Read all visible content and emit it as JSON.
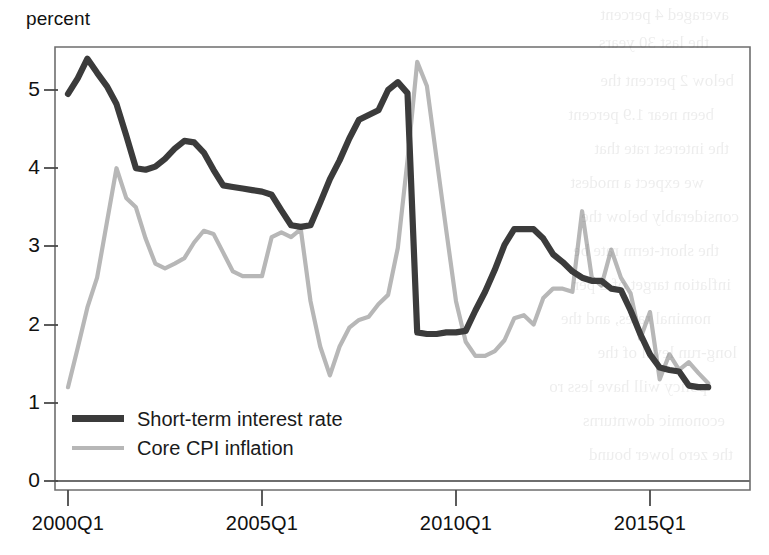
{
  "chart_data": {
    "type": "line",
    "title": "",
    "subtitle": "",
    "ylabel": "percent",
    "xlabel": "",
    "ylim": [
      0,
      5.65
    ],
    "yticks": [
      0,
      1,
      2,
      3,
      4,
      5
    ],
    "ytick_labels": [
      "0",
      "1",
      "2",
      "3",
      "4",
      "5"
    ],
    "xlim": [
      "2000Q1",
      "2016Q4"
    ],
    "xticks": [
      "2000Q1",
      "2005Q1",
      "2010Q1",
      "2015Q1"
    ],
    "xtick_labels": [
      "2000Q1",
      "2005Q1",
      "2010Q1",
      "2015Q1"
    ],
    "grid": false,
    "legend_position": "lower-left-inside",
    "colors": {
      "short_term_interest_rate": "#3b3b3b",
      "core_cpi_inflation": "#b7b7b7",
      "axis": "#5a5a5a",
      "background": "#ffffff"
    },
    "x": [
      "2000Q1",
      "2000Q2",
      "2000Q3",
      "2000Q4",
      "2001Q1",
      "2001Q2",
      "2001Q3",
      "2001Q4",
      "2002Q1",
      "2002Q2",
      "2002Q3",
      "2002Q4",
      "2003Q1",
      "2003Q2",
      "2003Q3",
      "2003Q4",
      "2004Q1",
      "2004Q2",
      "2004Q3",
      "2004Q4",
      "2005Q1",
      "2005Q2",
      "2005Q3",
      "2005Q4",
      "2006Q1",
      "2006Q2",
      "2006Q3",
      "2006Q4",
      "2007Q1",
      "2007Q2",
      "2007Q3",
      "2007Q4",
      "2008Q1",
      "2008Q2",
      "2008Q3",
      "2008Q4",
      "2009Q1",
      "2009Q2",
      "2009Q3",
      "2009Q4",
      "2010Q1",
      "2010Q2",
      "2010Q3",
      "2010Q4",
      "2011Q1",
      "2011Q2",
      "2011Q3",
      "2011Q4",
      "2012Q1",
      "2012Q2",
      "2012Q3",
      "2012Q4",
      "2013Q1",
      "2013Q2",
      "2013Q3",
      "2013Q4",
      "2014Q1",
      "2014Q2",
      "2014Q3",
      "2014Q4",
      "2015Q1",
      "2015Q2",
      "2015Q3",
      "2015Q4",
      "2016Q1",
      "2016Q2",
      "2016Q3"
    ],
    "series": [
      {
        "name": "Short-term interest rate",
        "color": "#3b3b3b",
        "values": [
          4.95,
          5.15,
          5.4,
          5.22,
          5.05,
          4.82,
          4.42,
          4.0,
          3.98,
          4.02,
          4.12,
          4.25,
          4.35,
          4.33,
          4.2,
          3.98,
          3.78,
          3.76,
          3.74,
          3.72,
          3.7,
          3.66,
          3.46,
          3.27,
          3.25,
          3.27,
          3.56,
          3.86,
          4.1,
          4.38,
          4.62,
          4.68,
          4.74,
          5.0,
          5.1,
          4.96,
          1.9,
          1.88,
          1.88,
          1.9,
          1.9,
          1.92,
          2.18,
          2.42,
          2.7,
          3.02,
          3.22,
          3.22,
          3.22,
          3.1,
          2.9,
          2.8,
          2.68,
          2.6,
          2.56,
          2.56,
          2.46,
          2.44,
          2.18,
          1.88,
          1.62,
          1.45,
          1.42,
          1.4,
          1.22,
          1.2,
          1.2
        ]
      },
      {
        "name": "Core CPI inflation",
        "color": "#b7b7b7",
        "values": [
          1.2,
          1.7,
          2.22,
          2.6,
          3.3,
          4.0,
          3.62,
          3.5,
          3.1,
          2.78,
          2.72,
          2.78,
          2.85,
          3.05,
          3.2,
          3.16,
          2.92,
          2.68,
          2.62,
          2.62,
          2.62,
          3.12,
          3.18,
          3.12,
          3.22,
          2.3,
          1.72,
          1.35,
          1.72,
          1.96,
          2.06,
          2.1,
          2.26,
          2.38,
          2.98,
          4.1,
          5.36,
          5.05,
          4.12,
          3.2,
          2.3,
          1.78,
          1.6,
          1.6,
          1.66,
          1.8,
          2.08,
          2.12,
          2.0,
          2.34,
          2.46,
          2.46,
          2.42,
          3.45,
          2.6,
          2.5,
          2.96,
          2.6,
          2.4,
          1.82,
          2.16,
          1.3,
          1.62,
          1.42,
          1.52,
          1.38,
          1.25
        ]
      }
    ]
  },
  "legend": {
    "entries": [
      {
        "label": "Short-term interest rate",
        "style": "series-dark"
      },
      {
        "label": "Core CPI inflation",
        "style": "series-light"
      }
    ]
  },
  "axes": {
    "y_title": "percent"
  },
  "bleed_text": {
    "lines": [
      "averaged 4 percent",
      "the last 30 years",
      "below 2 percent the",
      "been near 1.9 percent",
      "the interest rate that",
      "we expect a modest",
      "considerably below the",
      "the short-term rate be",
      "inflation target of 2 per",
      "nominal rates, and the",
      "long-run level of the",
      "policy will have less ro",
      "economic downturns",
      "the zero lower bound"
    ]
  }
}
